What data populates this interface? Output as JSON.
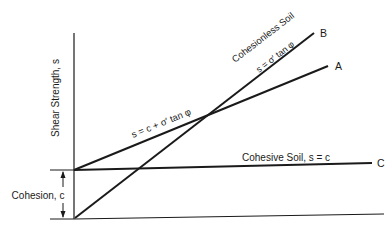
{
  "diagram": {
    "type": "soil-shear-strength-envelopes",
    "y_axis_label": "Shear Strength, s",
    "cohesion_label": "Cohesion, c",
    "lines": [
      {
        "id": "A",
        "label": "A",
        "equation": "s = c + σ′ tan φ",
        "description": "General soil (cohesion + friction)"
      },
      {
        "id": "B",
        "label": "B",
        "title": "Cohesionless Soil",
        "equation": "s = σ′ tan φ"
      },
      {
        "id": "C",
        "label": "C",
        "title": "Cohesive Soil, s = c"
      }
    ],
    "colors": {
      "line": "#1a1a1a",
      "background": "#ffffff"
    }
  }
}
